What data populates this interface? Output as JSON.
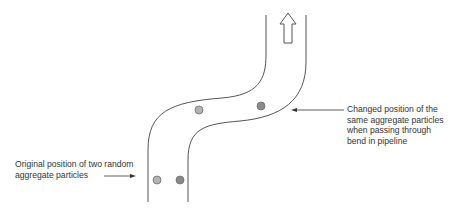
{
  "diagram": {
    "flow_direction": "upward",
    "colors": {
      "pipe_wall": "#555555",
      "particle_light": "#b4b4b4",
      "particle_dark": "#8a8a8a",
      "particle_stroke": "#6f6f6f",
      "text": "#333333"
    },
    "labels": {
      "original": {
        "lines": [
          "Original position of two random",
          "aggregate particles"
        ]
      },
      "changed": {
        "lines": [
          "Changed position of the",
          "same aggregate particles",
          "when passing through",
          "bend in pipeline"
        ]
      }
    },
    "particles": [
      {
        "name": "original-particle-1",
        "shade": "light"
      },
      {
        "name": "original-particle-2",
        "shade": "dark"
      },
      {
        "name": "changed-particle-1",
        "shade": "light"
      },
      {
        "name": "changed-particle-2",
        "shade": "dark"
      }
    ]
  }
}
